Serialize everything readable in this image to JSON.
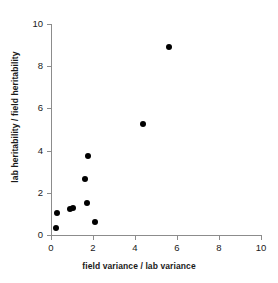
{
  "chart_data": {
    "type": "scatter",
    "title": "",
    "xlabel": "field variance / lab variance",
    "ylabel": "lab heritability / field heritability",
    "xlim": [
      0,
      10
    ],
    "ylim": [
      0,
      10
    ],
    "xticks": [
      "0",
      "2",
      "4",
      "6",
      "8",
      "10"
    ],
    "yticks": [
      "0",
      "2",
      "4",
      "6",
      "8",
      "10"
    ],
    "xtick_values": [
      0,
      2,
      4,
      6,
      8,
      10
    ],
    "ytick_values": [
      0,
      2,
      4,
      6,
      8,
      10
    ],
    "grid": false,
    "legend": null,
    "marker": {
      "shape": "circle",
      "color": "#000000",
      "size": 6
    },
    "axis_color": "#8c8c8c",
    "background": "#ffffff",
    "series": [
      {
        "name": "populations",
        "points": [
          {
            "x": 0.25,
            "y": 0.33
          },
          {
            "x": 0.3,
            "y": 1.05
          },
          {
            "x": 0.9,
            "y": 1.25
          },
          {
            "x": 1.05,
            "y": 1.3
          },
          {
            "x": 1.6,
            "y": 2.65
          },
          {
            "x": 1.7,
            "y": 1.5
          },
          {
            "x": 1.75,
            "y": 3.75
          },
          {
            "x": 2.1,
            "y": 0.6
          },
          {
            "x": 4.4,
            "y": 5.25
          },
          {
            "x": 5.6,
            "y": 8.9
          }
        ]
      }
    ]
  }
}
